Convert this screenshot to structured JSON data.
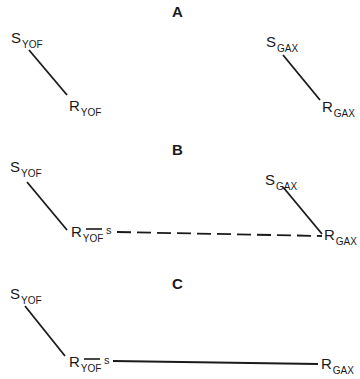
{
  "panels": [
    {
      "id": "A",
      "title": "A",
      "nodes": {
        "s_yof": {
          "main": "S",
          "sub": "YOF"
        },
        "r_yof": {
          "main": "R",
          "sub": "YOF"
        },
        "s_gax": {
          "main": "S",
          "sub": "GAX"
        },
        "r_gax": {
          "main": "R",
          "sub": "GAX"
        }
      },
      "connections": [
        {
          "from": "S_YOF",
          "to": "R_YOF",
          "style": "solid"
        },
        {
          "from": "S_GAX",
          "to": "R_GAX",
          "style": "solid"
        }
      ]
    },
    {
      "id": "B",
      "title": "B",
      "nodes": {
        "s_yof": {
          "main": "S",
          "sub": "YOF"
        },
        "r_yof": {
          "main": "R",
          "sub": "YOF"
        },
        "s_gax": {
          "main": "S",
          "sub": "GAX"
        },
        "r_gax": {
          "main": "R",
          "sub": "GAX"
        },
        "s_mark": "s"
      },
      "connections": [
        {
          "from": "S_YOF",
          "to": "R_YOF",
          "style": "solid"
        },
        {
          "from": "S_GAX",
          "to": "R_GAX",
          "style": "solid"
        },
        {
          "from": "R_YOF",
          "to": "s",
          "style": "solid"
        },
        {
          "from": "s",
          "to": "R_GAX",
          "style": "dashed"
        }
      ]
    },
    {
      "id": "C",
      "title": "C",
      "nodes": {
        "s_yof": {
          "main": "S",
          "sub": "YOF"
        },
        "r_yof": {
          "main": "R",
          "sub": "YOF"
        },
        "r_gax": {
          "main": "R",
          "sub": "GAX"
        },
        "s_mark": "s"
      },
      "connections": [
        {
          "from": "S_YOF",
          "to": "R_YOF",
          "style": "solid"
        },
        {
          "from": "R_YOF",
          "to": "s",
          "style": "solid"
        },
        {
          "from": "s",
          "to": "R_GAX",
          "style": "solid"
        }
      ]
    }
  ],
  "colors": {
    "ink": "#1a1a1a",
    "background": "#ffffff"
  }
}
